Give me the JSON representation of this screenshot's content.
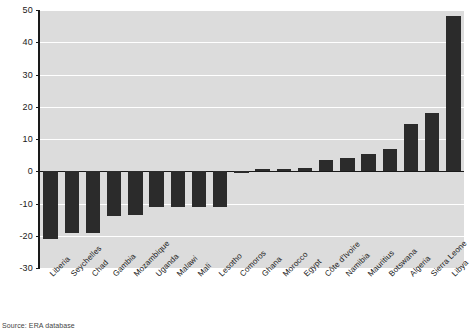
{
  "chart_data": {
    "type": "bar",
    "title": "",
    "subtitle": "",
    "xlabel": "",
    "ylabel": "",
    "ylim": [
      -30,
      50
    ],
    "yticks": [
      50,
      40,
      30,
      20,
      10,
      0,
      -10,
      -20,
      -30
    ],
    "ytick_labels": [
      "50",
      "40",
      "30",
      "20",
      "10",
      "0",
      "-10",
      "-20",
      "-30"
    ],
    "grid": "horizontal",
    "legend": "none",
    "orientation": "vertical",
    "bar_color": "#2b2b2b",
    "plot_background": "#dcdcdc",
    "gridline_color": "#ffffff",
    "categories": [
      "Liberia",
      "Seychelles",
      "Chad",
      "Gambia",
      "Mozambique",
      "Uganda",
      "Malawi",
      "Mali",
      "Lesotho",
      "Comoros",
      "Ghana",
      "Morocco",
      "Egypt",
      "Côte d'Ivoire",
      "Namibia",
      "Mauritius",
      "Botswana",
      "Algeria",
      "Sierra Leone",
      "Libya"
    ],
    "values": [
      -21,
      -19,
      -19,
      -14,
      -13.5,
      -11,
      -11,
      -11,
      -11,
      -0.6,
      0.8,
      0.8,
      1,
      3.5,
      4,
      5.5,
      7,
      14.5,
      18,
      48
    ],
    "annotations": []
  },
  "footer": {
    "source_note": "Source: ERA database"
  }
}
